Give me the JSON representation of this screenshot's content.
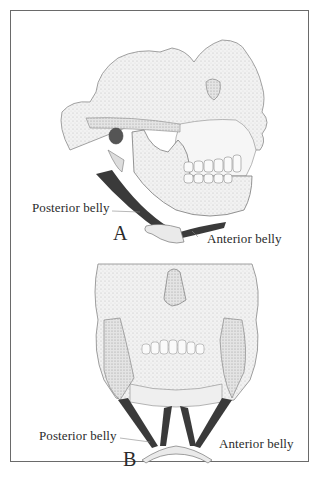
{
  "figure": {
    "panels": [
      {
        "id": "A",
        "letter": "A",
        "view": "lateral",
        "labels": {
          "posterior": "Posterior belly",
          "anterior": "Anterior belly"
        }
      },
      {
        "id": "B",
        "letter": "B",
        "view": "frontal-inferior",
        "labels": {
          "posterior": "Posterior belly",
          "anterior": "Anterior belly"
        }
      }
    ],
    "colors": {
      "border": "#6a6a6a",
      "bone_fill": "#efefef",
      "bone_line": "#7a7a7a",
      "muscle": "#3a3a3a",
      "text": "#2b2b2b"
    }
  }
}
